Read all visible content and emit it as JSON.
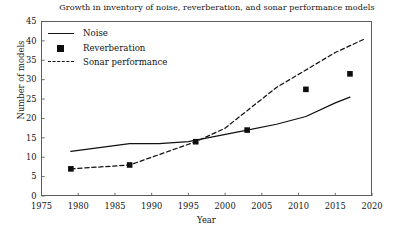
{
  "chart_data": {
    "type": "line",
    "title": "Growth in inventory of noise, reverberation, and sonar performance models",
    "xlabel": "Year",
    "ylabel": "Number of models",
    "xlim": [
      1975,
      2020
    ],
    "ylim": [
      0,
      45
    ],
    "xticks": [
      1975,
      1980,
      1985,
      1990,
      1995,
      2000,
      2005,
      2010,
      2015,
      2020
    ],
    "yticks": [
      0,
      5,
      10,
      15,
      20,
      25,
      30,
      35,
      40,
      45
    ],
    "grid": false,
    "legend_position": "top-left",
    "series": [
      {
        "name": "Noise",
        "style": "solid-line",
        "color": "#111111",
        "x": [
          1979,
          1987,
          1991,
          1995,
          1999,
          2003,
          2007,
          2011,
          2015,
          2017
        ],
        "values": [
          11.5,
          13.5,
          13.5,
          14.0,
          15.5,
          17.0,
          18.5,
          20.5,
          24.0,
          25.5
        ]
      },
      {
        "name": "Reverberation",
        "style": "filled-square-markers",
        "color": "#0d0d0d",
        "x": [
          1979,
          1987,
          1996,
          2003,
          2011,
          2017
        ],
        "values": [
          7.0,
          8.0,
          14.0,
          17.0,
          27.5,
          31.5
        ]
      },
      {
        "name": "Sonar performance",
        "style": "dashed-line",
        "color": "#111111",
        "x": [
          1979,
          1987,
          1996,
          2000,
          2003,
          2007,
          2011,
          2015,
          2019
        ],
        "values": [
          7.0,
          8.0,
          14.0,
          17.5,
          22.0,
          28.0,
          32.5,
          37.0,
          40.5
        ]
      }
    ]
  },
  "axes": {
    "ytick_labels": [
      "45",
      "40",
      "35",
      "30",
      "25",
      "20",
      "15",
      "10",
      "5",
      "0"
    ],
    "xtick_labels": [
      "1975",
      "1980",
      "1985",
      "1990",
      "1995",
      "2000",
      "2005",
      "2010",
      "2015",
      "2020"
    ]
  },
  "legend": {
    "items": [
      {
        "label": "Noise"
      },
      {
        "label": "Reverberation"
      },
      {
        "label": "Sonar performance"
      }
    ]
  }
}
